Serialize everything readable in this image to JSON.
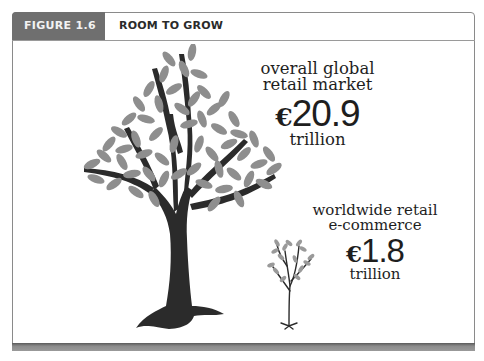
{
  "figure": {
    "number_label": "FIGURE 1.6",
    "title": "ROOM TO GROW"
  },
  "stats": [
    {
      "label_line1": "overall global",
      "label_line2": "retail market",
      "currency": "€",
      "value": "20.9",
      "unit": "trillion",
      "illustration": "large-tree-icon"
    },
    {
      "label_line1": "worldwide retail",
      "label_line2": "e-commerce",
      "currency": "€",
      "value": "1.8",
      "unit": "trillion",
      "illustration": "small-tree-icon"
    }
  ],
  "colors": {
    "tab_background": "#6f6f6f",
    "leaf": "#8e8e8e",
    "trunk": "#2b2b2b",
    "text": "#1e1e1e"
  }
}
